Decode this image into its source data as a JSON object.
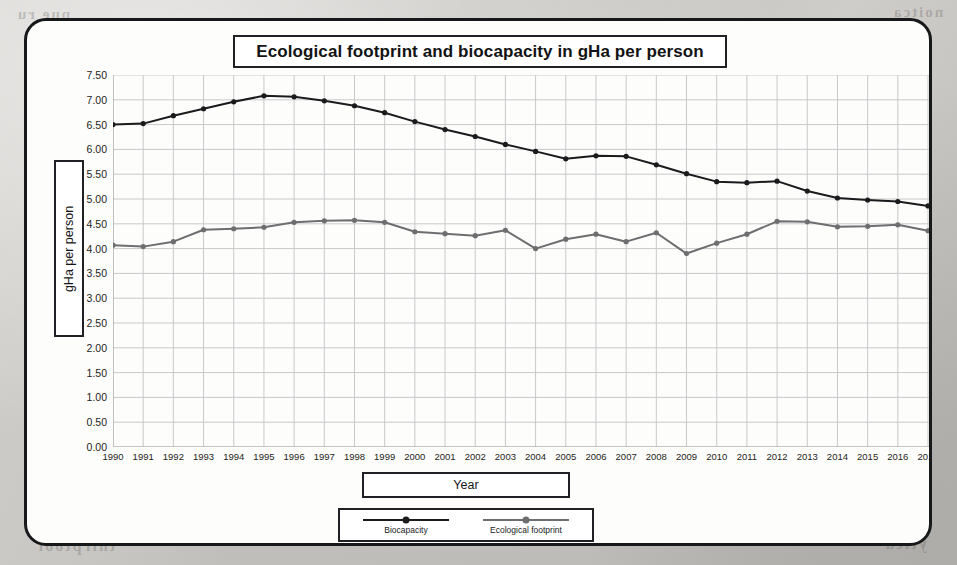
{
  "chart_data": {
    "type": "line",
    "title": "Ecological footprint and biocapacity in gHa per person",
    "xlabel": "Year",
    "ylabel": "gHa per person",
    "grid": true,
    "legend_position": "bottom",
    "ylim": [
      0.0,
      7.5
    ],
    "ytick_step": 0.5,
    "y_ticks": [
      "0.00",
      "0.50",
      "1.00",
      "1.50",
      "2.00",
      "2.50",
      "3.00",
      "3.50",
      "4.00",
      "4.50",
      "5.00",
      "5.50",
      "6.00",
      "6.50",
      "7.00",
      "7.50"
    ],
    "categories": [
      "1990",
      "1991",
      "1992",
      "1993",
      "1994",
      "1995",
      "1996",
      "1997",
      "1998",
      "1999",
      "2000",
      "2001",
      "2002",
      "2003",
      "2004",
      "2005",
      "2006",
      "2007",
      "2008",
      "2009",
      "2010",
      "2011",
      "2012",
      "2013",
      "2014",
      "2015",
      "2016",
      "2017"
    ],
    "series": [
      {
        "name": "Biocapacity",
        "color": "#1b1b1d",
        "values": [
          6.5,
          6.52,
          6.68,
          6.82,
          6.96,
          7.08,
          7.06,
          6.98,
          6.88,
          6.74,
          6.56,
          6.4,
          6.26,
          6.1,
          5.96,
          5.81,
          5.87,
          5.86,
          5.69,
          5.51,
          5.35,
          5.33,
          5.36,
          5.16,
          5.02,
          4.98,
          4.95,
          4.86
        ]
      },
      {
        "name": "Ecological footprint",
        "color": "#6e6e70",
        "values": [
          4.07,
          4.04,
          4.14,
          4.38,
          4.4,
          4.43,
          4.53,
          4.56,
          4.57,
          4.53,
          4.34,
          4.3,
          4.26,
          4.37,
          4.0,
          4.19,
          4.29,
          4.14,
          4.32,
          3.9,
          4.11,
          4.29,
          4.55,
          4.54,
          4.44,
          4.45,
          4.48,
          4.36
        ]
      }
    ]
  },
  "legend": {
    "items": [
      {
        "label": "Biocapacity"
      },
      {
        "label": "Ecological footprint"
      }
    ]
  },
  "bleed_through": {
    "top_left": "pue ru",
    "top_right": "noitca",
    "bottom_left": "tnirptoof",
    "bottom_right": "ytica",
    "mid_left": "ytic"
  }
}
